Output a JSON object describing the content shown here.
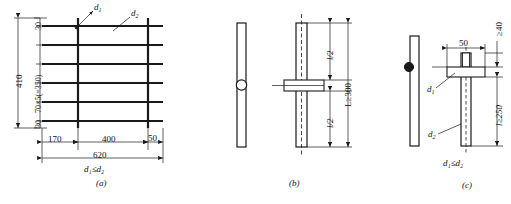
{
  "figure": {
    "caption_partial": "",
    "panels": [
      {
        "id": "a",
        "caption": "(a)",
        "note": "d₁≤d₂",
        "note_plain": "d1 ≤ d2",
        "bar_labels": [
          {
            "name": "d1",
            "text": "d",
            "sub": "1"
          },
          {
            "name": "d2",
            "text": "d",
            "sub": "2"
          }
        ],
        "vertical_dimensions": [
          {
            "name": "top-edge-spacing",
            "value": "30"
          },
          {
            "name": "spacing-string",
            "value": "70×5(=350)"
          },
          {
            "name": "bottom-edge-spacing",
            "value": "30"
          },
          {
            "name": "overall-height",
            "value": "410"
          }
        ],
        "horizontal_dimensions": [
          {
            "name": "left-overhang",
            "value": "170"
          },
          {
            "name": "bar-spacing",
            "value": "400"
          },
          {
            "name": "right-overhang",
            "value": "50"
          },
          {
            "name": "overall-width",
            "value": "620"
          }
        ],
        "grid": {
          "horizontal_bars": 6,
          "vertical_bars": 2
        }
      },
      {
        "id": "b",
        "caption": "(b)",
        "dimensions": [
          {
            "name": "upper-half-length",
            "value": "l",
            "sub": "/2"
          },
          {
            "name": "lower-half-length",
            "value": "l",
            "sub": "/2"
          },
          {
            "name": "total-length",
            "value": "L≥300"
          }
        ]
      },
      {
        "id": "c",
        "caption": "(c)",
        "note": "d₁≤d₂",
        "note_plain": "d1 ≤ d2",
        "bar_labels": [
          {
            "name": "d1",
            "text": "d",
            "sub": "1"
          },
          {
            "name": "d2",
            "text": "d",
            "sub": "2"
          }
        ],
        "dimensions": [
          {
            "name": "plate-width",
            "value": "50"
          },
          {
            "name": "top-clearance",
            "value": "≥40"
          },
          {
            "name": "embed-length",
            "value": "l≥250"
          }
        ]
      }
    ],
    "colors": {
      "line": "#1a1a1a",
      "background": "#ffffff",
      "bar_heavy": "#1a1a1a"
    }
  }
}
